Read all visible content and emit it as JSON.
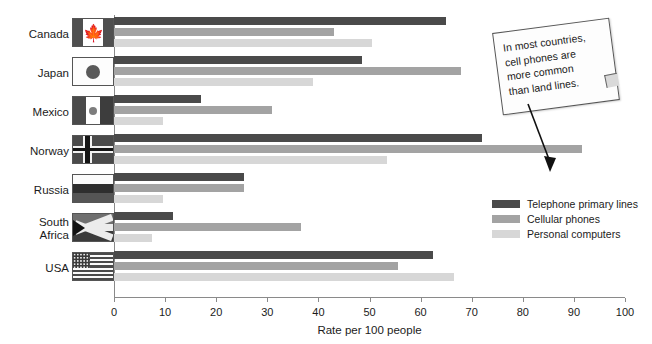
{
  "chart_data": {
    "type": "bar",
    "orientation": "horizontal",
    "title": "",
    "xlabel": "Rate per 100 people",
    "ylabel": "",
    "xlim": [
      0,
      100
    ],
    "xticks": [
      0,
      10,
      20,
      30,
      40,
      50,
      60,
      70,
      80,
      90,
      100
    ],
    "grid": false,
    "legend_position": "right",
    "categories": [
      "Canada",
      "Japan",
      "Mexico",
      "Norway",
      "Russia",
      "South Africa",
      "USA"
    ],
    "series": [
      {
        "name": "Telephone primary lines",
        "color": "#4a4a4a",
        "values": [
          65,
          48.5,
          17,
          72,
          25.5,
          11.5,
          62.5
        ]
      },
      {
        "name": "Cellular phones",
        "color": "#a3a3a3",
        "values": [
          43,
          68,
          31,
          91.5,
          25.5,
          36.5,
          55.5
        ]
      },
      {
        "name": "Personal computers",
        "color": "#d7d7d7",
        "values": [
          50.5,
          39,
          9.5,
          53.5,
          9.5,
          7.5,
          66.5
        ]
      }
    ],
    "annotation": {
      "text": "In most countries,\ncell phones are\nmore common\nthan land lines.",
      "points_to": "Norway cellular phones bar"
    }
  },
  "rows": [
    {
      "label": "Canada",
      "flag": "canada-flag"
    },
    {
      "label": "Japan",
      "flag": "japan-flag"
    },
    {
      "label": "Mexico",
      "flag": "mexico-flag"
    },
    {
      "label": "Norway",
      "flag": "norway-flag"
    },
    {
      "label": "Russia",
      "flag": "russia-flag"
    },
    {
      "label": "South\nAfrica",
      "flag": "south-africa-flag"
    },
    {
      "label": "USA",
      "flag": "usa-flag"
    }
  ],
  "axis": {
    "title": "Rate per 100 people",
    "ticks": [
      "0",
      "10",
      "20",
      "30",
      "40",
      "50",
      "60",
      "70",
      "80",
      "90",
      "100"
    ]
  },
  "legend": {
    "items": [
      {
        "label": "Telephone primary lines",
        "color": "#4a4a4a"
      },
      {
        "label": "Cellular phones",
        "color": "#a3a3a3"
      },
      {
        "label": "Personal computers",
        "color": "#d7d7d7"
      }
    ]
  },
  "callout": {
    "text": "In most countries,\ncell phones are\nmore common\nthan land lines."
  }
}
